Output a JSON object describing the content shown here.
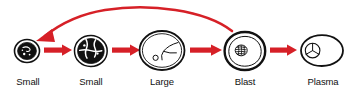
{
  "diagram": {
    "accent_color": "#d62027",
    "outline_color": "#111111",
    "background_color": "#ffffff",
    "stages": [
      {
        "id": "small-round",
        "label": "Small\nround",
        "label_line1": "Small",
        "label_line2": "round",
        "icon": "small-round-cell-icon",
        "nucleus_fill": "#111111",
        "cx": 27,
        "cy": 51,
        "rx": 13,
        "ry": 12,
        "label_x": 3,
        "label_y": 68
      },
      {
        "id": "small-cleaved",
        "label": "Small\ncleaved",
        "label_line1": "Small",
        "label_line2": "cleaved",
        "icon": "small-cleaved-cell-icon",
        "nucleus_fill": "#111111",
        "cx": 91,
        "cy": 51,
        "rx": 17,
        "ry": 16,
        "label_x": 62,
        "label_y": 68
      },
      {
        "id": "large-cleaved",
        "label": "Large\ncleaved",
        "label_line1": "Large",
        "label_line2": "cleaved",
        "icon": "large-cleaved-cell-icon",
        "nucleus_fill": "#ffffff",
        "cx": 162,
        "cy": 51,
        "rx": 23,
        "ry": 20,
        "label_x": 133,
        "label_y": 68
      },
      {
        "id": "blast-cells",
        "label": "Blast\ncells",
        "label_line1": "Blast",
        "label_line2": "cells",
        "icon": "blast-cell-icon",
        "nucleus_fill": "#ffffff",
        "cx": 245,
        "cy": 51,
        "rx": 20,
        "ry": 19,
        "label_x": 220,
        "label_y": 68
      },
      {
        "id": "plasma-cells",
        "label": "Plasma\ncells",
        "label_line1": "Plasma",
        "label_line2": "cells",
        "icon": "plasma-cell-icon",
        "nucleus_fill": "#ffffff",
        "cx": 322,
        "cy": 51,
        "rx": 21,
        "ry": 16,
        "label_x": 294,
        "label_y": 68
      }
    ],
    "arrows": [
      {
        "id": "arrow-1",
        "from": "small-round",
        "to": "small-cleaved",
        "x1": 44,
        "x2": 71,
        "y": 50
      },
      {
        "id": "arrow-2",
        "from": "small-cleaved",
        "to": "large-cleaved",
        "x1": 112,
        "x2": 138,
        "y": 50
      },
      {
        "id": "arrow-3",
        "from": "large-cleaved",
        "to": "blast-cells",
        "x1": 188,
        "x2": 222,
        "y": 50
      },
      {
        "id": "arrow-4",
        "from": "blast-cells",
        "to": "plasma-cells",
        "x1": 268,
        "x2": 298,
        "y": 50
      }
    ],
    "feedback_arrow": {
      "id": "feedback-arrow",
      "from": "blast-cells",
      "to": "small-round",
      "description": "curved arrow looping back from blast cells to small round cell",
      "start_x": 232,
      "start_y": 31,
      "end_x": 38,
      "end_y": 40,
      "apex_x": 130,
      "apex_y": 8
    }
  }
}
